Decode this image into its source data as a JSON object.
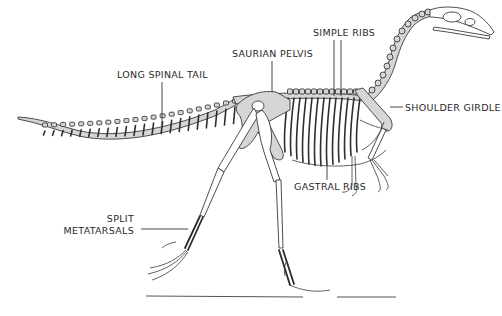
{
  "diagram": {
    "labels": {
      "long_spinal_tail": "LONG SPINAL TAIL",
      "saurian_pelvis": "SAURIAN PELVIS",
      "simple_ribs": "SIMPLE RIBS",
      "shoulder_girdle": "SHOULDER GIRDLE",
      "gastral_ribs": "GASTRAL RIBS",
      "split_metatarsals_line1": "SPLIT",
      "split_metatarsals_line2": "METATARSALS"
    },
    "colors": {
      "bone_fill": "#d6d6d6",
      "outline": "#3a3a3a",
      "label_text": "#2a2a2a",
      "background": "#ffffff"
    }
  }
}
